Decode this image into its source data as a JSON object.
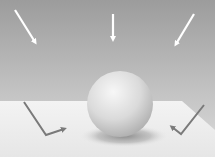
{
  "diagram": {
    "colors": {
      "sky_top": "#9a9a9a",
      "sky_bottom": "#d6d6d6",
      "floor": "#ececec",
      "sphere_light": "#f2f2f2",
      "sphere_dark": "#b5b5b5",
      "shadow": "#8a8a8a",
      "incoming_arrow": "#ffffff",
      "bounce_arrow": "#7a7a7a"
    },
    "incoming_arrows": [
      {
        "name": "left-diagonal",
        "x1": 15,
        "y1": 10,
        "x2": 37,
        "y2": 44
      },
      {
        "name": "center-vertical",
        "x1": 113,
        "y1": 14,
        "x2": 113,
        "y2": 41
      },
      {
        "name": "right-diagonal",
        "x1": 194,
        "y1": 14,
        "x2": 174,
        "y2": 46
      }
    ],
    "bounce_arrows": [
      {
        "name": "left-bounce",
        "points": "24,102 46,135 67,128"
      },
      {
        "name": "right-bounce",
        "points": "204,105 181,134 170,126"
      }
    ],
    "sphere": {
      "cx": 120,
      "cy": 104,
      "r": 33
    },
    "floor": {
      "points": "8,101 182,101 215,130 215,157 0,157 0,101"
    }
  }
}
